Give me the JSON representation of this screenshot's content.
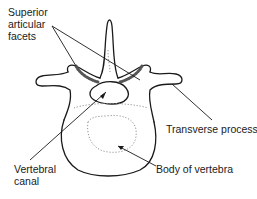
{
  "figure": {
    "labels": {
      "superior_articular_facets_line1": "Superior",
      "superior_articular_facets_line2": "articular",
      "superior_articular_facets_line3": "facets",
      "transverse_process": "Transverse process",
      "vertebral_canal_line1": "Vertebral",
      "vertebral_canal_line2": "canal",
      "body_of_vertebra": "Body of vertebra"
    },
    "colors": {
      "line": "#1a1a1a",
      "background": "#ffffff"
    }
  }
}
